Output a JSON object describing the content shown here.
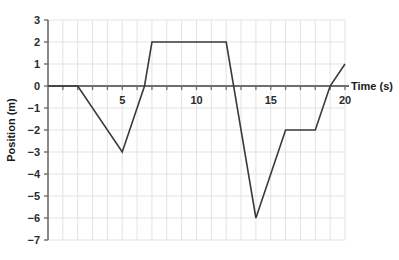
{
  "chart_data": {
    "type": "line",
    "title": "",
    "xlabel": "Time (s)",
    "ylabel": "Position (m)",
    "xlim": [
      0,
      20
    ],
    "ylim": [
      -7,
      3
    ],
    "grid": true,
    "legend": "none",
    "x_ticks": [
      5,
      10,
      15,
      20
    ],
    "x_tick_labels": [
      "5",
      "10",
      "15",
      "20"
    ],
    "x_minor_step": 1,
    "y_ticks": [
      3,
      2,
      1,
      0,
      -1,
      -2,
      -3,
      -4,
      -5,
      -6,
      -7
    ],
    "y_tick_labels": [
      "3",
      "2",
      "1",
      "0",
      "−1",
      "−2",
      "−3",
      "−4",
      "−5",
      "−6",
      "−7"
    ],
    "series": [
      {
        "name": "Position",
        "color": "#3a3a3a",
        "x": [
          0,
          2,
          5,
          6.5,
          7,
          12,
          14,
          16,
          18,
          19,
          20
        ],
        "y": [
          0,
          0,
          -3,
          0,
          2,
          2,
          -6,
          -2,
          -2,
          0,
          1
        ]
      }
    ],
    "annotations": []
  },
  "axis": {
    "x_axis_label": "Time (s)",
    "y_axis_label": "Position (m)"
  },
  "colors": {
    "line": "#3a3a3a",
    "axis": "#6e6e6e",
    "grid": "#e3e3e6",
    "text": "#1a1a1a",
    "background": "#ffffff"
  }
}
